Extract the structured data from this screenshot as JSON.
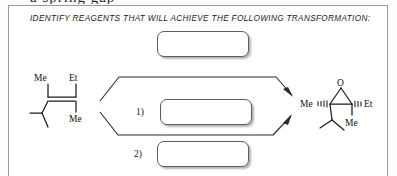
{
  "page": {
    "cropped_header_fragment": "a spring gap",
    "background_color": "#ffffff",
    "border_color": "#9a9a9a"
  },
  "prompt": {
    "text": "IDENTIFY REAGENTS THAT WILL ACHIEVE THE FOLLOWING TRANSFORMATION:"
  },
  "answer_boxes": [
    {
      "id": "top",
      "label": "",
      "value": ""
    },
    {
      "id": "one",
      "label": "1)",
      "value": ""
    },
    {
      "id": "two",
      "label": "2)",
      "value": ""
    }
  ],
  "step_labels": {
    "one": "1)",
    "two": "2)"
  },
  "reactant": {
    "name": "trisubstituted-alkene",
    "atom_labels": {
      "me_top": "Me",
      "et_top": "Et",
      "me_bottom": "Me"
    }
  },
  "product": {
    "name": "trisubstituted-epoxide",
    "atom_labels": {
      "oxygen": "O",
      "me_left": "Me",
      "et_right": "Et",
      "me_bottom": "Me"
    }
  },
  "arrows": {
    "upper": "reaction-arrow-upper",
    "lower": "reaction-arrow-lower"
  },
  "colors": {
    "ink": "#1c1c1c",
    "arrow": "#2a2a2a",
    "box_border": "#5d5d5d",
    "panel_border": "#9a9a9a"
  }
}
